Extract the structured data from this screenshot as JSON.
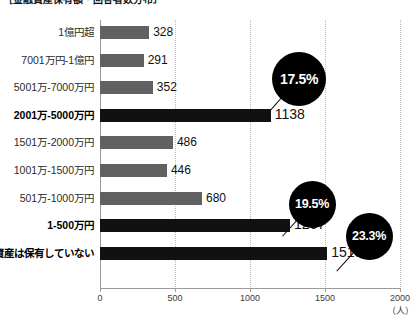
{
  "chart_data": {
    "type": "bar",
    "orientation": "horizontal",
    "title": "［金融資産保有額・回答者数分布］",
    "xlabel": "",
    "ylabel": "",
    "unit_label": "（人）",
    "xlim": [
      0,
      2000
    ],
    "xticks": [
      0,
      500,
      1000,
      1500,
      2000
    ],
    "xtick_labels": [
      "0",
      "500",
      "1000",
      "1500",
      "2000"
    ],
    "grid": true,
    "legend": "none",
    "categories": [
      "1億円超",
      "7001万円-1億円",
      "5001万-7000万円",
      "2001万-5000万円",
      "1501万-2000万円",
      "1001万-1500万円",
      "501万-1000万円",
      "1-500万円",
      "資産は保有していない"
    ],
    "values": [
      328,
      291,
      352,
      1138,
      486,
      446,
      680,
      1267,
      1515
    ],
    "highlighted": [
      false,
      false,
      false,
      true,
      false,
      false,
      false,
      true,
      true
    ],
    "colors": {
      "bar_default": "#616161",
      "bar_highlight": "#111111",
      "bubble_fill": "#000000",
      "bubble_text": "#ffffff",
      "gridline": "#b9b9b9",
      "axis": "#9a9a9a",
      "text": "#1a1a1a"
    },
    "annotations": [
      {
        "text": "17.5%",
        "attached_to_category": "2001万-5000万円",
        "attached_to_value": 1138
      },
      {
        "text": "19.5%",
        "attached_to_category": "1-500万円",
        "attached_to_value": 1267
      },
      {
        "text": "23.3%",
        "attached_to_category": "資産は保有していない",
        "attached_to_value": 1515
      }
    ]
  }
}
